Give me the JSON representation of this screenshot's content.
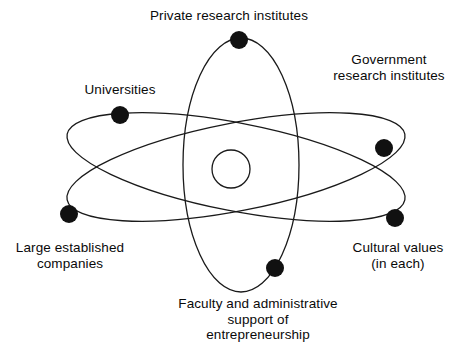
{
  "diagram": {
    "background_color": "#ffffff",
    "stroke_color": "#1a1a1a",
    "electron_color": "#111111",
    "nucleus": {
      "name": "nucleus",
      "cx": 231,
      "cy": 169,
      "r": 19
    },
    "orbits": [
      {
        "name": "vertical-orbit",
        "cx": 241,
        "cy": 165,
        "rx": 58,
        "ry": 127,
        "rotation": 0
      },
      {
        "name": "tilted-up-orbit",
        "cx": 236,
        "cy": 167,
        "rx": 172,
        "ry": 44,
        "rotation": -11
      },
      {
        "name": "tilted-down-orbit",
        "cx": 236,
        "cy": 167,
        "rx": 172,
        "ry": 44,
        "rotation": 11
      }
    ],
    "electrons": [
      {
        "name": "electron-private-research-institutes",
        "cx": 239,
        "cy": 40,
        "r": 9
      },
      {
        "name": "electron-universities",
        "cx": 120,
        "cy": 115,
        "r": 9
      },
      {
        "name": "electron-government-research-institutes",
        "cx": 384,
        "cy": 148,
        "r": 9
      },
      {
        "name": "electron-large-established-companies",
        "cx": 69,
        "cy": 214,
        "r": 9
      },
      {
        "name": "electron-cultural-values",
        "cx": 395,
        "cy": 218,
        "r": 9
      },
      {
        "name": "electron-faculty-support",
        "cx": 275,
        "cy": 268,
        "r": 9
      }
    ],
    "labels": {
      "private_research_institutes": "Private research institutes",
      "government_research_institutes": "Government\nresearch institutes",
      "universities": "Universities",
      "large_established_companies": "Large established\ncompanies",
      "cultural_values": "Cultural values\n(in each)",
      "faculty_support": "Faculty and administrative\nsupport of\nentrepreneurship"
    }
  }
}
